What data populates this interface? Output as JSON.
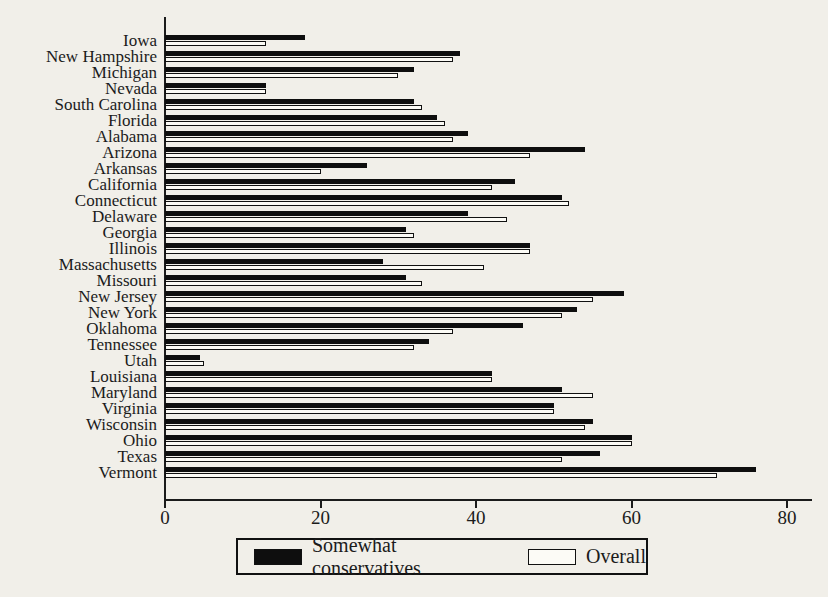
{
  "chart_data": {
    "type": "bar",
    "orientation": "horizontal",
    "title": "",
    "xlabel": "",
    "ylabel": "",
    "grid": false,
    "legend_position": "bottom",
    "xticks": [
      0,
      20,
      40,
      60,
      80
    ],
    "xlim": [
      0,
      83
    ],
    "categories": [
      "Iowa",
      "New Hampshire",
      "Michigan",
      "Nevada",
      "South Carolina",
      "Florida",
      "Alabama",
      "Arizona",
      "Arkansas",
      "California",
      "Connecticut",
      "Delaware",
      "Georgia",
      "Illinois",
      "Massachusetts",
      "Missouri",
      "New Jersey",
      "New York",
      "Oklahoma",
      "Tennessee",
      "Utah",
      "Louisiana",
      "Maryland",
      "Virginia",
      "Wisconsin",
      "Ohio",
      "Texas",
      "Vermont"
    ],
    "series": [
      {
        "name": "Somewhat conservatives",
        "color": "#0e0e0e",
        "values": [
          18,
          38,
          32,
          13,
          32,
          35,
          39,
          54,
          26,
          45,
          51,
          39,
          31,
          47,
          28,
          31,
          59,
          53,
          46,
          34,
          4.5,
          42,
          51,
          50,
          55,
          60,
          56,
          76
        ]
      },
      {
        "name": "Overall",
        "color": "#fcfbf6",
        "values": [
          13,
          37,
          30,
          13,
          33,
          36,
          37,
          47,
          20,
          42,
          52,
          44,
          32,
          47,
          41,
          33,
          55,
          51,
          37,
          32,
          5,
          42,
          55,
          50,
          54,
          60,
          51,
          71
        ]
      }
    ]
  },
  "colors": {
    "background": "#f1efe9",
    "bar_dark": "#0e0e0e",
    "bar_light": "#fcfbf6",
    "axis": "#1b1b1b"
  }
}
